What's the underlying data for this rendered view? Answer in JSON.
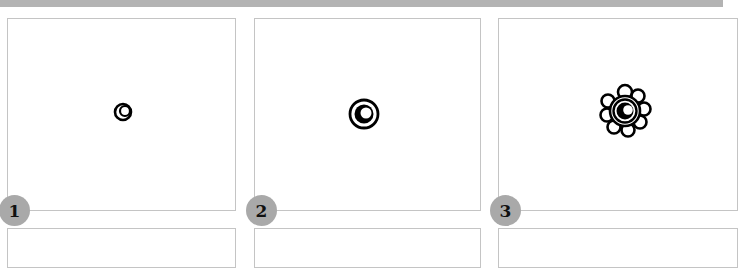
{
  "steps": [
    {
      "number": "1",
      "figure": "small-crescent-ring"
    },
    {
      "number": "2",
      "figure": "ring-with-crescent-core"
    },
    {
      "number": "3",
      "figure": "flower-rosette-with-core"
    }
  ],
  "colors": {
    "top_bar": "#b3b3b3",
    "panel_border": "#c4c4c4",
    "badge_fill": "#a9a9a9",
    "ink": "#000000"
  }
}
